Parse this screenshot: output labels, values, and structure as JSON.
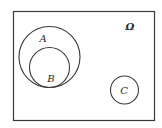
{
  "diagram": {
    "type": "venn",
    "universe": {
      "label": "Ω",
      "frame": {
        "x": 13.5,
        "y": 11.5,
        "width": 141,
        "height": 109
      },
      "label_pos": {
        "x": 130,
        "y": 30
      }
    },
    "sets": [
      {
        "name": "A",
        "label": "A",
        "cx": 49.5,
        "cy": 57,
        "r": 30.5,
        "label_pos": {
          "x": 43,
          "y": 42
        },
        "relation": "contains B"
      },
      {
        "name": "B",
        "label": "B",
        "cx": 49.5,
        "cy": 67.5,
        "r": 20,
        "label_pos": {
          "x": 51,
          "y": 82
        },
        "relation": "subset of A, internally tangent at bottom"
      },
      {
        "name": "C",
        "label": "C",
        "cx": 124.5,
        "cy": 90,
        "r": 14,
        "label_pos": {
          "x": 124,
          "y": 94
        },
        "relation": "disjoint from A and B"
      }
    ],
    "stroke_color": "#3a3a3a",
    "background_color": "#ffffff"
  }
}
